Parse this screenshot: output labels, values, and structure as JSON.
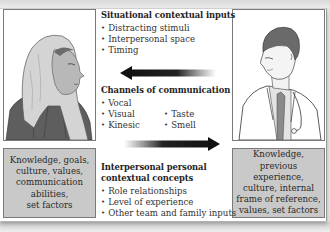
{
  "diagram": {
    "situational": {
      "title": "Situational contextual inputs",
      "items": [
        "Distracting stimuli",
        "Interpersonal space",
        "Timing"
      ]
    },
    "channels": {
      "title": "Channels of communication",
      "col1": [
        "Vocal",
        "Visual",
        "Kinesic"
      ],
      "col2": [
        "Taste",
        "Smell"
      ]
    },
    "interpersonal": {
      "title_line1": "Interpersonal personal",
      "title_line2": "contextual concepts",
      "items": [
        "Role relationships",
        "Level of experience",
        "Other team and family inputs"
      ]
    },
    "left_person": {
      "figure": "woman-in-headscarf",
      "factors": "Knowledge, goals,\nculture, values,\ncommunication\nabilities,\nset factors"
    },
    "right_person": {
      "figure": "doctor-with-stethoscope",
      "factors": "Knowledge,\nprevious experience,\nculture, internal\nframe of reference,\nvalues, set factors"
    },
    "arrows": [
      {
        "direction": "left",
        "meaning": "message from right person to left person"
      },
      {
        "direction": "right",
        "meaning": "message from left person to right person"
      }
    ],
    "colors": {
      "factor_box": "#c9c9c9",
      "border": "#7a7a7a",
      "arrow": "#111111",
      "headscarf": "#d4d4d4",
      "robe": "#5e5e5e",
      "hair": "#6a6a6a"
    }
  }
}
